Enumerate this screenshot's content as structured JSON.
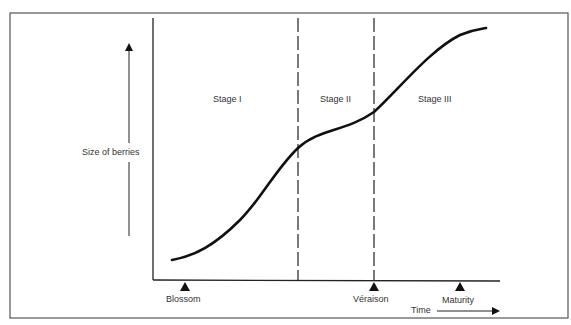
{
  "diagram": {
    "title": "",
    "y_axis_label": "Size of berries",
    "x_axis_label": "Time",
    "stages": [
      {
        "label": "Stage I"
      },
      {
        "label": "Stage II"
      },
      {
        "label": "Stage III"
      }
    ],
    "markers": [
      {
        "label": "Blossom"
      },
      {
        "label": "Véraison"
      },
      {
        "label": "Maturity"
      }
    ],
    "colors": {
      "line": "#111111",
      "border": "#555555",
      "text": "#333333"
    }
  }
}
